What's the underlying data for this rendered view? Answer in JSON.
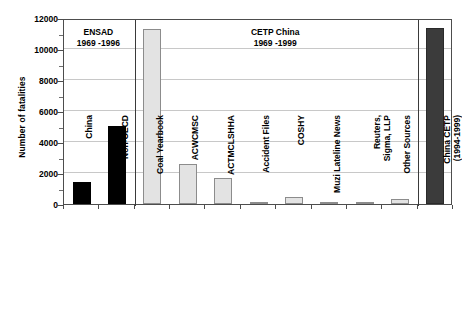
{
  "chart_data": {
    "type": "bar",
    "title": "",
    "xlabel": "",
    "ylabel": "Number of fatalities",
    "ylim": [
      0,
      12000
    ],
    "ytick_values": [
      0,
      2000,
      4000,
      6000,
      8000,
      10000,
      12000
    ],
    "ytick_labels": [
      "0",
      "2000",
      "4000",
      "6000",
      "8000",
      "10000",
      "12000"
    ],
    "yminor_step": 1000,
    "grid": "horizontal-major",
    "legend": "none",
    "categories": [
      "China",
      "Non-OECD",
      "Coal Yearbook",
      "ACWCMSC",
      "ACTMCLSHHA",
      "Accident Files",
      "COSHY",
      "Muzi Lateline News",
      "Reuters, Sigma, LLP",
      "Other Sources",
      "China CETP (1994-1999)"
    ],
    "values": [
      1400,
      5050,
      11300,
      2550,
      1700,
      150,
      450,
      80,
      130,
      330,
      11350
    ],
    "bar_styles": [
      "dark",
      "dark",
      "light",
      "light",
      "light",
      "light",
      "light",
      "light",
      "light",
      "light",
      "gray"
    ],
    "annotations": [
      {
        "name": "ensad-group",
        "line1": "ENSAD",
        "line2": "1969 -1996"
      },
      {
        "name": "cetp-china-group",
        "line1": "CETP China",
        "line2": "1969 -1999"
      }
    ],
    "colors": {
      "dark_bar": "#000000",
      "light_bar": "#e3e3e3",
      "gray_bar": "#3b3b3b",
      "axis": "#4d4d4d",
      "grid": "#c8c8c8"
    }
  },
  "xlabels_wrapped": [
    {
      "l1": "China",
      "l2": ""
    },
    {
      "l1": "Non-OECD",
      "l2": ""
    },
    {
      "l1": "Coal Yearbook",
      "l2": ""
    },
    {
      "l1": "ACWCMSC",
      "l2": ""
    },
    {
      "l1": "ACTMCLSHHA",
      "l2": ""
    },
    {
      "l1": "Accident Files",
      "l2": ""
    },
    {
      "l1": "COSHY",
      "l2": ""
    },
    {
      "l1": "Muzi Lateline News",
      "l2": ""
    },
    {
      "l1": "Reuters,",
      "l2": "Sigma, LLP"
    },
    {
      "l1": "Other Sources",
      "l2": ""
    },
    {
      "l1": "China CETP",
      "l2": "(1994-1999)"
    }
  ]
}
